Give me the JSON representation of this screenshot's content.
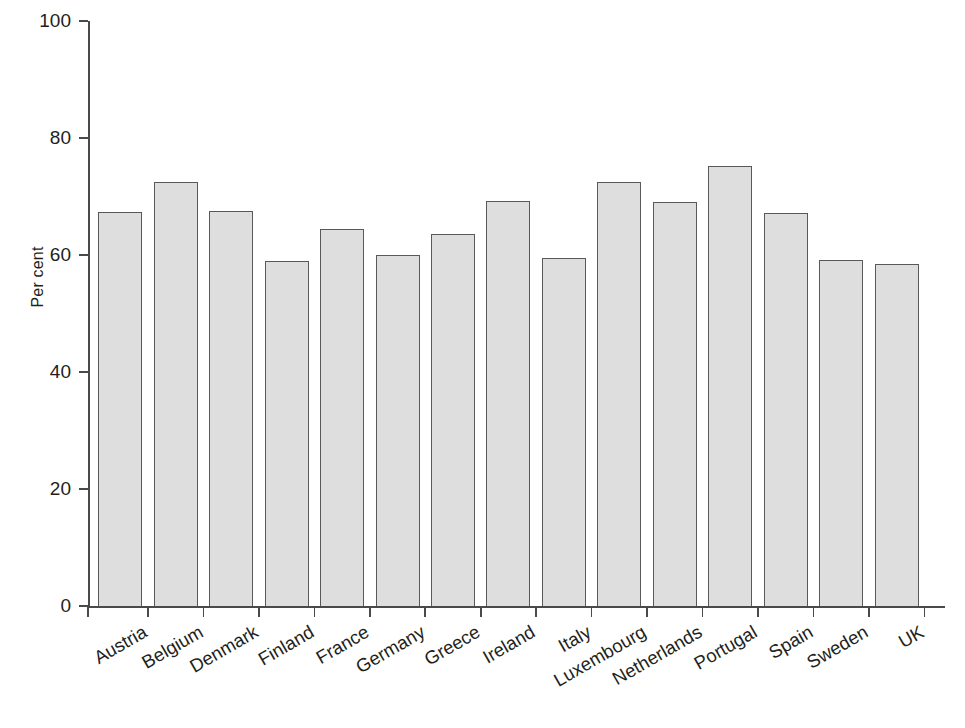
{
  "chart_data": {
    "type": "bar",
    "title": "",
    "xlabel": "",
    "ylabel": "Per cent",
    "ylim": [
      0,
      100
    ],
    "yticks": [
      0,
      20,
      40,
      60,
      80,
      100
    ],
    "ytick_labels": [
      "0",
      "20",
      "40",
      "60",
      "80",
      "100"
    ],
    "grid": false,
    "legend": null,
    "bar_fill_color": "#dedede",
    "bar_border_color": "#59595b",
    "axis_color": "#4a4a4a",
    "categories": [
      "Austria",
      "Belgium",
      "Denmark",
      "Finland",
      "France",
      "Germany",
      "Greece",
      "Ireland",
      "Italy",
      "Luxembourg",
      "Netherlands",
      "Portugal",
      "Spain",
      "Sweden",
      "UK"
    ],
    "values": [
      67.4,
      72.5,
      67.6,
      59.0,
      64.4,
      60.0,
      63.6,
      69.3,
      59.5,
      72.5,
      69.1,
      75.2,
      67.2,
      59.2,
      58.5
    ]
  }
}
